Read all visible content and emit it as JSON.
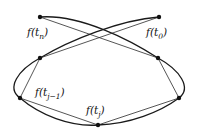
{
  "diagram": {
    "type": "polygonal-approximation-of-closed-curve",
    "labels": {
      "t_n": {
        "func": "f(",
        "sub": "n",
        "close": ")",
        "var": "t"
      },
      "t_0": {
        "func": "f(",
        "sub": "0",
        "close": ")",
        "var": "t"
      },
      "t_jm1": {
        "func": "f(",
        "sub": "j−1",
        "close": ")",
        "var": "t"
      },
      "t_j": {
        "func": "f(",
        "sub": "j",
        "close": ")",
        "var": "t"
      }
    },
    "points": [
      "f(t_n)",
      "f(t_0)",
      "upper-left",
      "upper-right",
      "f(t_{j-1})",
      "right",
      "f(t_j)"
    ],
    "colors": {
      "ink": "#1a1a1a",
      "background": "#ffffff"
    }
  }
}
